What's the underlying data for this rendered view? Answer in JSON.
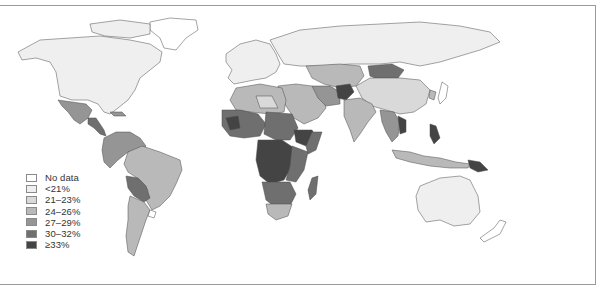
{
  "map": {
    "type": "choropleth-world",
    "legend": {
      "items": [
        {
          "label": "No data",
          "color": "#ffffff"
        },
        {
          "label": "<21%",
          "color": "#efefef"
        },
        {
          "label": "21–23%",
          "color": "#d9d9d9"
        },
        {
          "label": "24–26%",
          "color": "#b9b9b9"
        },
        {
          "label": "27–29%",
          "color": "#959595"
        },
        {
          "label": "30–32%",
          "color": "#6f6f6f"
        },
        {
          "label": "≥33%",
          "color": "#444444"
        }
      ]
    },
    "regions": {
      "north_america": "<21%",
      "mexico": "27–29%",
      "central_america": "30–32%",
      "northern_south_america": "27–29%",
      "brazil": "24–26%",
      "bolivia_paraguay": "30–32%",
      "argentina_chile": "24–26%",
      "uruguay": "No data",
      "europe": "<21%",
      "russia": "<21%",
      "north_africa": "24–26%",
      "west_africa": "30–32%",
      "central_africa": "≥33%",
      "east_africa": "30–32%",
      "ethiopia": "≥33%",
      "southern_africa": "30–32%",
      "south_africa": "24–26%",
      "madagascar": "30–32%",
      "middle_east": "24–26%",
      "central_asia": "24–26%",
      "afghanistan": "≥33%",
      "mongolia": "30–32%",
      "china": "21–23%",
      "india": "24–26%",
      "southeast_asia": "27–29%",
      "indonesia": "24–26%",
      "papua_new_guinea": "≥33%",
      "australia": "<21%",
      "new_zealand": "No data",
      "greenland": "No data"
    }
  }
}
